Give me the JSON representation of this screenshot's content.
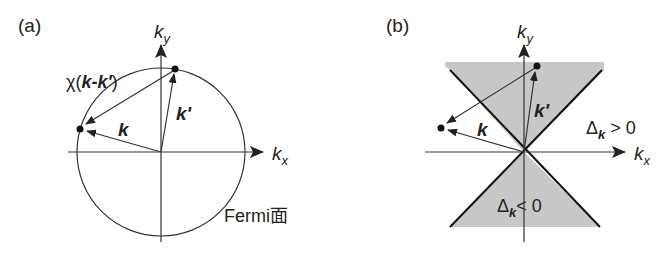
{
  "panel_a": {
    "label": "(a)",
    "axis_y": "k",
    "axis_y_sub": "y",
    "axis_x": "k",
    "axis_x_sub": "x",
    "vector_k": "k",
    "vector_k_prime": "k'",
    "chi_label_prefix": "χ(",
    "chi_label_k": "k",
    "chi_label_minus": "-",
    "chi_label_kp": "k'",
    "chi_label_suffix": ")",
    "fermi_label": "Fermi面"
  },
  "panel_b": {
    "label": "(b)",
    "axis_y": "k",
    "axis_y_sub": "y",
    "axis_x": "k",
    "axis_x_sub": "x",
    "vector_k": "k",
    "vector_k_prime": "k'",
    "delta_pos_symbol": "Δ",
    "delta_pos_sub": "k",
    "delta_pos_rel": " > 0",
    "delta_neg_symbol": "Δ",
    "delta_neg_sub": "k",
    "delta_neg_rel": "< 0",
    "shade_color": "#c8c8c8"
  }
}
